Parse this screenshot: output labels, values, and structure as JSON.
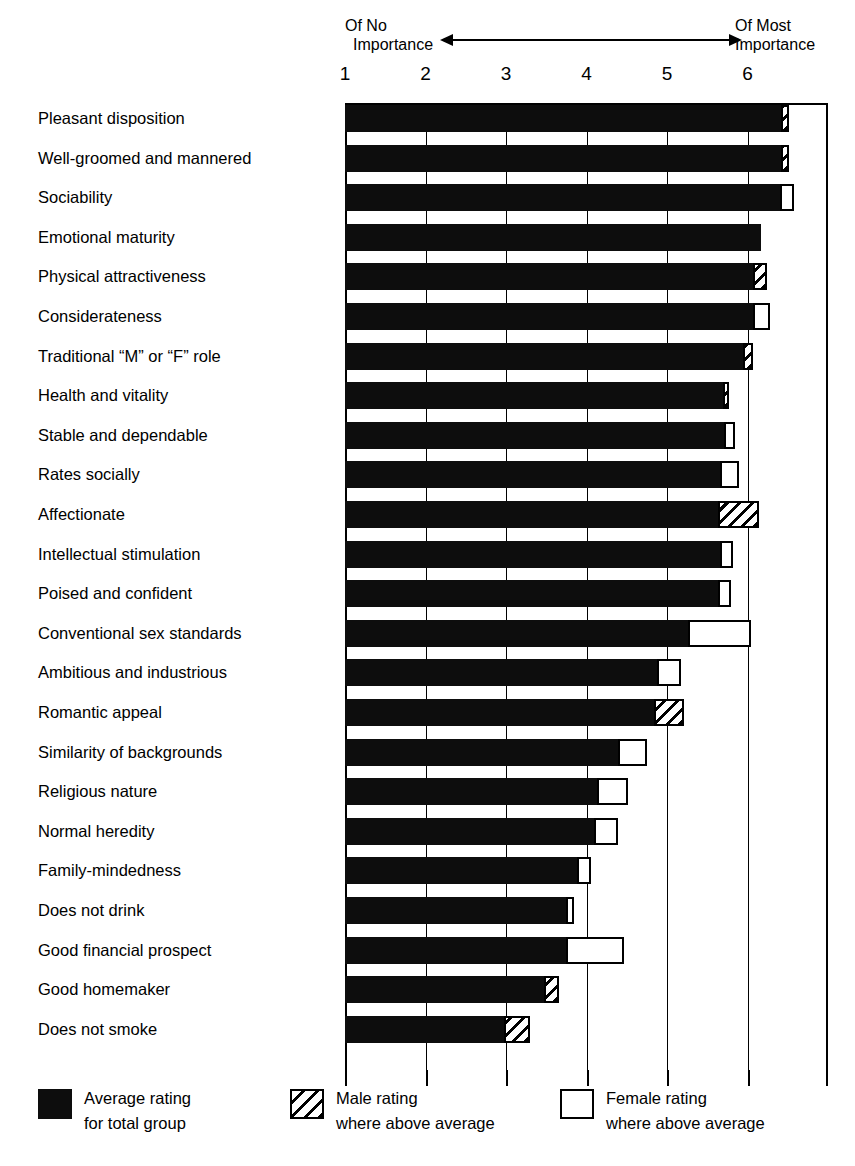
{
  "header": {
    "left_line1": "Of No",
    "left_line2": "Importance",
    "right_line1": "Of Most",
    "right_line2": "Importance",
    "arrow_icon": "double-headed-arrow"
  },
  "legend": {
    "items": [
      {
        "key": "avg",
        "swatch": "solid-black-square",
        "line1": "Average rating",
        "line2": "for total group"
      },
      {
        "key": "male",
        "swatch": "hatched-square",
        "line1": "Male rating",
        "line2": "where above average"
      },
      {
        "key": "female",
        "swatch": "white-outline-square",
        "line1": "Female rating",
        "line2": "where above average"
      }
    ]
  },
  "chart_data": {
    "type": "bar",
    "orientation": "horizontal",
    "title": "",
    "xlabel": "",
    "ylabel": "",
    "xlim": [
      1,
      7
    ],
    "tick_values": [
      1,
      2,
      3,
      4,
      5,
      6
    ],
    "tick_labels": [
      "1",
      "2",
      "3",
      "4",
      "5",
      "6"
    ],
    "grid": true,
    "legend_position": "bottom",
    "scale_low_label": "Of No Importance",
    "scale_high_label": "Of Most Importance",
    "series": [
      {
        "name": "Average rating for total group",
        "key": "average"
      },
      {
        "name": "Male rating where above average",
        "key": "male"
      },
      {
        "name": "Female rating where above average",
        "key": "female"
      }
    ],
    "categories": [
      "Pleasant disposition",
      "Well-groomed and mannered",
      "Sociability",
      "Emotional maturity",
      "Physical attractiveness",
      "Considerateness",
      "Traditional “M” or “F” role",
      "Health and vitality",
      "Stable and dependable",
      "Rates socially",
      "Affectionate",
      "Intellectual stimulation",
      "Poised and confident",
      "Conventional sex standards",
      "Ambitious and industrious",
      "Romantic appeal",
      "Similarity of backgrounds",
      "Religious nature",
      "Normal heredity",
      "Family-mindedness",
      "Does not drink",
      "Good financial prospect",
      "Good homemaker",
      "Does not smoke"
    ],
    "rows": [
      {
        "label": "Pleasant disposition",
        "average": 6.42,
        "male": 6.52,
        "female": null
      },
      {
        "label": "Well-groomed and mannered",
        "average": 6.42,
        "male": 6.51,
        "female": null
      },
      {
        "label": "Sociability",
        "average": 6.4,
        "male": null,
        "female": 6.58
      },
      {
        "label": "Emotional maturity",
        "average": 6.17,
        "male": null,
        "female": null
      },
      {
        "label": "Physical attractiveness",
        "average": 6.07,
        "male": 6.24,
        "female": null
      },
      {
        "label": "Considerateness",
        "average": 6.07,
        "male": null,
        "female": 6.28
      },
      {
        "label": "Traditional “M” or “F” role",
        "average": 5.94,
        "male": 6.07,
        "female": null
      },
      {
        "label": "Health and vitality",
        "average": 5.69,
        "male": 5.77,
        "female": null
      },
      {
        "label": "Stable and dependable",
        "average": 5.71,
        "male": null,
        "female": 5.85
      },
      {
        "label": "Rates socially",
        "average": 5.66,
        "male": null,
        "female": 5.89
      },
      {
        "label": "Affectionate",
        "average": 5.63,
        "male": 6.14,
        "female": null
      },
      {
        "label": "Intellectual stimulation",
        "average": 5.66,
        "male": null,
        "female": 5.82
      },
      {
        "label": "Poised and confident",
        "average": 5.63,
        "male": null,
        "female": 5.79
      },
      {
        "label": "Conventional sex standards",
        "average": 5.26,
        "male": null,
        "female": 6.04
      },
      {
        "label": "Ambitious and industrious",
        "average": 4.87,
        "male": null,
        "female": 5.17
      },
      {
        "label": "Romantic appeal",
        "average": 4.84,
        "male": 5.21,
        "female": null
      },
      {
        "label": "Similarity of backgrounds",
        "average": 4.39,
        "male": null,
        "female": 4.75
      },
      {
        "label": "Religious nature",
        "average": 4.13,
        "male": null,
        "female": 4.52
      },
      {
        "label": "Normal heredity",
        "average": 4.09,
        "male": null,
        "female": 4.39
      },
      {
        "label": "Family-mindedness",
        "average": 3.88,
        "male": null,
        "female": 4.05
      },
      {
        "label": "Does not drink",
        "average": 3.74,
        "male": null,
        "female": 3.84
      },
      {
        "label": "Good financial prospect",
        "average": 3.74,
        "male": null,
        "female": 4.46
      },
      {
        "label": "Good homemaker",
        "average": 3.47,
        "male": 3.66,
        "female": null
      },
      {
        "label": "Does not smoke",
        "average": 2.98,
        "male": 3.3,
        "female": null
      }
    ]
  }
}
